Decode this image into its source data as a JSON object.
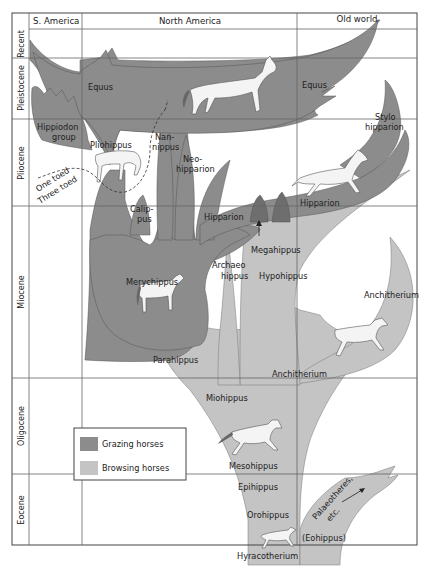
{
  "diagram": {
    "type": "phylogenetic-tree",
    "columns": [
      "S. America",
      "North America",
      "Old world"
    ],
    "epochs": [
      "Recent",
      "Pleistocene",
      "Pliocene",
      "Miocene",
      "Oligocene",
      "Eocene"
    ],
    "colors": {
      "grazing": "#8c8c8c",
      "browsing": "#c4c4c4",
      "dark_overlap": "#6e6e6e",
      "grid": "#666666"
    },
    "legend": {
      "items": [
        {
          "label": "Grazing horses",
          "color": "#8c8c8c"
        },
        {
          "label": "Browsing horses",
          "color": "#c4c4c4"
        }
      ]
    },
    "taxa": {
      "equus_na": "Equus",
      "equus_ow": "Equus",
      "hippidion_1": "Hippiodon",
      "hippidion_2": "group",
      "pliohippus": "Pliohippus",
      "nannippus_1": "Nan-",
      "nannippus_2": "nippus",
      "neohipparion_1": "Neo-",
      "neohipparion_2": "hipparion",
      "calippus_1": "Calip-",
      "calippus_2": "pus",
      "hipparion_na": "Hipparion",
      "hipparion_ow": "Hipparion",
      "stylohipparion_1": "Stylo",
      "stylohipparion_2": "hipparion",
      "megahippus": "Megahippus",
      "archaeohippus_1": "Archaeo",
      "archaeohippus_2": "hippus",
      "hypohippus": "Hypohippus",
      "merychippus": "Merychippus",
      "parahippus": "Parahippus",
      "anchitherium_na": "Anchitherium",
      "anchitherium_ow": "Anchitherium",
      "miohippus": "Miohippus",
      "mesohippus": "Mesohippus",
      "epihippus": "Epihippus",
      "orohippus": "Orohippus",
      "hyracotherium": "Hyracotherium",
      "eohippus": "(Eohippus)",
      "palaeotheres_1": "Palaeotheres,",
      "palaeotheres_2": "etc."
    },
    "annotations": {
      "one_toed": "One toed",
      "three_toed": "Three toed"
    }
  }
}
